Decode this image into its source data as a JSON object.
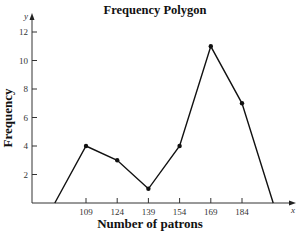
{
  "chart_data": {
    "type": "line",
    "title": "Frequency Polygon",
    "xlabel": "Number of patrons",
    "ylabel": "Frequency",
    "x_axis_var": "x",
    "y_axis_var": "y",
    "x_tick_labels": [
      "109",
      "124",
      "139",
      "154",
      "169",
      "184"
    ],
    "y_tick_labels": [
      "2",
      "4",
      "6",
      "8",
      "10",
      "12"
    ],
    "x": [
      94,
      109,
      124,
      139,
      154,
      169,
      184,
      199
    ],
    "values": [
      0,
      4,
      3,
      1,
      4,
      11,
      7,
      0
    ],
    "marked_points": [
      {
        "x": 109,
        "y": 4
      },
      {
        "x": 124,
        "y": 3
      },
      {
        "x": 139,
        "y": 1
      },
      {
        "x": 154,
        "y": 4
      },
      {
        "x": 169,
        "y": 11
      },
      {
        "x": 184,
        "y": 7
      }
    ],
    "ylim": [
      0,
      13
    ],
    "xlim": [
      79,
      214
    ],
    "grid": false,
    "legend": null
  }
}
